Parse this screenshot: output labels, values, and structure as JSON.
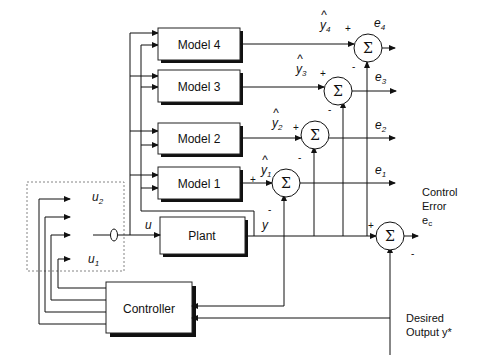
{
  "blocks": {
    "model4": "Model 4",
    "model3": "Model 3",
    "model2": "Model 2",
    "model1": "Model 1",
    "plant": "Plant",
    "controller": "Controller"
  },
  "summing_junctions": {
    "symbol": "Σ",
    "plus": "+",
    "minus": "-"
  },
  "signals": {
    "yhat_symbol": "y",
    "hat": "^",
    "yhat4_sub": "4",
    "yhat3_sub": "3",
    "yhat2_sub": "2",
    "yhat1_sub": "1",
    "e_symbol": "e",
    "e4_sub": "4",
    "e3_sub": "3",
    "e2_sub": "2",
    "e1_sub": "1",
    "ec_sub": "c",
    "u": "u",
    "u2_sub": "2",
    "u1_sub": "1",
    "y": "y"
  },
  "labels": {
    "control_error_line1": "Control",
    "control_error_line2": "Error",
    "desired_output_line1": "Desired",
    "desired_output_line2": "Output y*"
  }
}
